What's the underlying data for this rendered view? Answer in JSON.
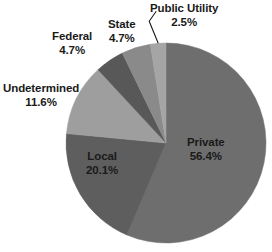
{
  "chart_data": {
    "type": "pie",
    "title": "",
    "subtitle": "",
    "xlabel": "",
    "ylabel": "",
    "grid": false,
    "legend": "none",
    "units": "percent",
    "label_format": "{name} {value}%",
    "start_angle_deg": 0,
    "direction": "clockwise",
    "categories": [
      "Private",
      "Local",
      "Undetermined",
      "Federal",
      "State",
      "Public Utility"
    ],
    "values": [
      56.4,
      20.1,
      11.6,
      4.7,
      4.7,
      2.5
    ],
    "colors": [
      "#6e6e6e",
      "#5e5e5e",
      "#9e9e9e",
      "#585858",
      "#8a8a8a",
      "#a5a5a5"
    ],
    "slices": [
      {
        "name": "Private",
        "value": 56.4,
        "value_text": "56.4%",
        "color": "#6e6e6e",
        "label_position": "inside",
        "leader_line": false
      },
      {
        "name": "Local",
        "value": 20.1,
        "value_text": "20.1%",
        "color": "#5e5e5e",
        "label_position": "inside",
        "leader_line": false
      },
      {
        "name": "Undetermined",
        "value": 11.6,
        "value_text": "11.6%",
        "color": "#9e9e9e",
        "label_position": "outside",
        "leader_line": false
      },
      {
        "name": "Federal",
        "value": 4.7,
        "value_text": "4.7%",
        "color": "#585858",
        "label_position": "outside",
        "leader_line": false
      },
      {
        "name": "State",
        "value": 4.7,
        "value_text": "4.7%",
        "color": "#8a8a8a",
        "label_position": "outside",
        "leader_line": false
      },
      {
        "name": "Public Utility",
        "value": 2.5,
        "value_text": "2.5%",
        "color": "#a5a5a5",
        "label_position": "outside",
        "leader_line": true
      }
    ]
  },
  "labels": {
    "private": {
      "name": "Private",
      "value": "56.4%"
    },
    "local": {
      "name": "Local",
      "value": "20.1%"
    },
    "undetermined": {
      "name": "Undetermined",
      "value": "11.6%"
    },
    "federal": {
      "name": "Federal",
      "value": "4.7%"
    },
    "state": {
      "name": "State",
      "value": "4.7%"
    },
    "public_utility": {
      "name": "Public Utility",
      "value": "2.5%"
    }
  },
  "geometry": {
    "center_x": 166,
    "center_y": 143,
    "radius": 100
  },
  "style": {
    "background": "#ffffff",
    "label_color": "#1a1a1a",
    "leader_line_color": "#1a1a1a"
  }
}
